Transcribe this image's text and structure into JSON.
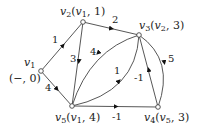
{
  "diagram": {
    "type": "weighted directed graph (shortest path labeling)",
    "nodes": [
      {
        "id": "v1",
        "label": "v1",
        "annotation": "(−, 0)",
        "x": 41,
        "y": 71
      },
      {
        "id": "v2",
        "label": "v2(v1, 1)",
        "x": 83,
        "y": 22
      },
      {
        "id": "v3",
        "label": "v3(v2, 3)",
        "x": 139,
        "y": 35
      },
      {
        "id": "v4",
        "label": "v4(v5, 3)",
        "x": 158,
        "y": 107
      },
      {
        "id": "v5",
        "label": "v5(v1, 4)",
        "x": 72,
        "y": 106
      }
    ],
    "edges": [
      {
        "from": "v1",
        "to": "v2",
        "weight": "1"
      },
      {
        "from": "v1",
        "to": "v5",
        "weight": "4"
      },
      {
        "from": "v2",
        "to": "v3",
        "weight": "2"
      },
      {
        "from": "v2",
        "to": "v5",
        "weight": "3"
      },
      {
        "from": "v3",
        "to": "v5",
        "weight": "4"
      },
      {
        "from": "v5",
        "to": "v3",
        "weight": "1"
      },
      {
        "from": "v4",
        "to": "v3",
        "weight": "-1"
      },
      {
        "from": "v3",
        "to": "v4",
        "weight": "5"
      },
      {
        "from": "v5",
        "to": "v4",
        "weight": "-1"
      }
    ]
  }
}
